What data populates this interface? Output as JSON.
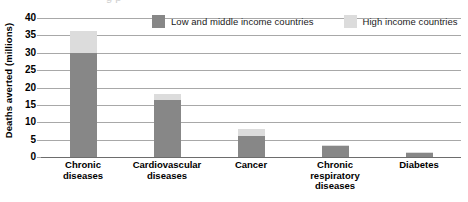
{
  "chart_data": {
    "type": "bar",
    "title": "",
    "xlabel": "",
    "ylabel": "Deaths averted (millions)",
    "ylim": [
      0,
      40
    ],
    "ytick_step": 5,
    "yticks": [
      "40",
      "35",
      "30",
      "25",
      "20",
      "15",
      "10",
      "5",
      "0"
    ],
    "grid": true,
    "stacked": true,
    "legend_position": "top-right",
    "categories": [
      "Chronic diseases",
      "Cardiovascular diseases",
      "Cancer",
      "Chronic respiratory diseases",
      "Diabetes"
    ],
    "category_lines": [
      [
        "Chronic",
        "diseases"
      ],
      [
        "Cardiovascular",
        "diseases"
      ],
      [
        "Cancer"
      ],
      [
        "Chronic",
        "respiratory",
        "diseases"
      ],
      [
        "Diabetes"
      ]
    ],
    "series": [
      {
        "name": "Low and middle income countries",
        "color": "#878787",
        "values": [
          29.8,
          16.5,
          6.1,
          3.2,
          1.1
        ]
      },
      {
        "name": "High income countries",
        "color": "#dcdcdc",
        "values": [
          6.4,
          1.6,
          1.9,
          0.4,
          0.3
        ]
      }
    ],
    "totals": [
      36.2,
      18.1,
      8.0,
      3.6,
      1.4
    ]
  },
  "legend": {
    "entries": [
      {
        "label": "Low and middle income countries",
        "color": "#878787"
      },
      {
        "label": "High income countries",
        "color": "#dcdcdc"
      }
    ]
  },
  "axis": {
    "y_title": "Deaths averted (millions)"
  },
  "colors": {
    "low_middle_income": "#878787",
    "high_income": "#dcdcdc",
    "gridline": "#a8a8a8",
    "baseline": "#6d6d6d",
    "text": "#000000",
    "background": "#ffffff"
  },
  "top_clipped_text": "g p"
}
